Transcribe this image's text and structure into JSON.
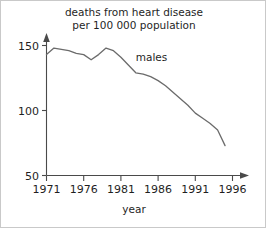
{
  "chart_data": {
    "type": "line",
    "title": "deaths from heart disease per 100 000 population",
    "title_line1": "deaths from heart disease",
    "title_line2": "per 100 000 population",
    "xlabel": "year",
    "ylabel": "",
    "xlim": [
      1971,
      1997
    ],
    "ylim": [
      50,
      155
    ],
    "grid": false,
    "legend_position": "inline-annotation",
    "xticks": [
      1971,
      1976,
      1981,
      1986,
      1991,
      1996
    ],
    "xtick_labels": [
      "1971",
      "1976",
      "1981",
      "1986",
      "1991",
      "1996"
    ],
    "yticks": [
      50,
      100,
      150
    ],
    "ytick_labels": [
      "50",
      "100",
      "150"
    ],
    "annotations": [
      {
        "text": "males",
        "x": 1983,
        "y": 138
      }
    ],
    "series": [
      {
        "name": "males",
        "color": "#6b6b6b",
        "x": [
          1971,
          1972,
          1973,
          1974,
          1975,
          1976,
          1977,
          1978,
          1979,
          1980,
          1981,
          1982,
          1983,
          1984,
          1985,
          1986,
          1987,
          1988,
          1989,
          1990,
          1991,
          1992,
          1993,
          1994,
          1995
        ],
        "values": [
          143,
          148,
          147,
          146,
          144,
          143,
          139,
          143,
          148,
          146,
          141,
          135,
          129,
          128,
          126,
          123,
          119,
          114,
          109,
          104,
          98,
          94,
          90,
          85,
          73
        ]
      }
    ]
  },
  "axis": {
    "x_arrow": "arrow-right",
    "y_arrow": "arrow-up"
  }
}
